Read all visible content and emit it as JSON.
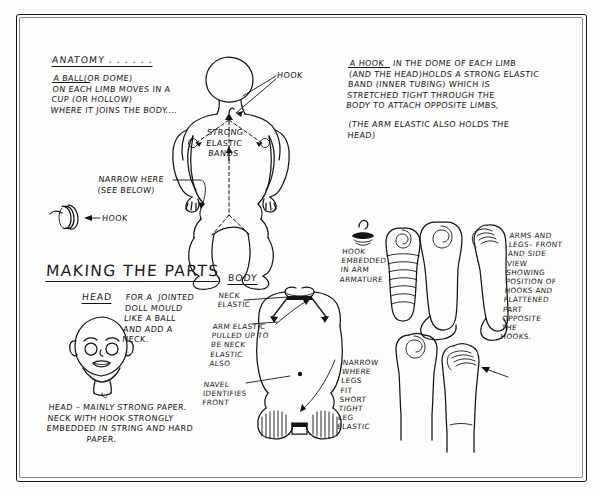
{
  "document": {
    "title": "Anatomy / Making the Parts — jointed doll construction notes",
    "medium": "hand-drawn ink sketch on paper"
  },
  "sections": {
    "anatomy": {
      "heading": "ANATOMY . . . . . .",
      "paragraph_lead": "A BALL",
      "paragraph": "A BALL(OR DOME)\nON EACH LIMB MOVES IN A\nCUP (OR HOLLOW)\nWHERE IT JOINS THE BODY...."
    },
    "hook_note": {
      "lead": "A HOOK",
      "paragraph": "A HOOK   IN THE DOME OF EACH LIMB\n(AND THE HEAD)HOLDS A STRONG ELASTIC\nBAND (INNER TUBING) WHICH IS\nSTRETCHED TIGHT THROUGH THE\nBODY TO ATTACH OPPOSITE LIMBS,",
      "paragraph2": "(THE ARM ELASTIC ALSO HOLDS THE\nHEAD)"
    },
    "making_the_parts": {
      "heading": "MAKING THE PARTS",
      "head_label": "HEAD",
      "head_paragraph": "FOR A  JOINTED\nDOLL MOULD\nLIKE A BALL\nAND ADD A\nNECK.",
      "head_note": "HEAD – MAINLY STRONG PAPER.\nNECK WITH HOOK STRONGLY\nEMBEDDED IN STRING AND HARD\n              PAPER."
    },
    "body": {
      "heading": "BODY",
      "label_neck_elastic": "NECK\nELASTIC",
      "label_arm_elastic": "ARM ELASTIC\nPULLED UP TO\nBE NECK\nELASTIC\nALSO",
      "label_navel": "NAVEL\nIDENTIFIES\nFRONT",
      "label_narrow_legs": "NARROW\nWHERE\nLEGS\nFIT\nSHORT\nTIGHT\nLEG\nELASTIC"
    },
    "limbs": {
      "label_hook_embedded": "HOOK\nEMBEDDED\nIN ARM\nARMATURE",
      "paragraph": "ARMS AND\nLEGS– FRONT\nAND SIDE\nVIEW\nSHOWING\nPOSITION OF\nHOOKS AND\nFLATTENED\nPART\nOPPOSITE\nTHE\nHOOKS."
    }
  },
  "callouts": {
    "hook_top": "HOOK",
    "strong_elastic_bands": "STRONG\nELASTIC\nBANDS",
    "narrow_here": "NARROW HERE\n(SEE BELOW)",
    "hook_left": "HOOK"
  },
  "colors": {
    "ink": "#141414",
    "paper": "#fdfdfb"
  }
}
